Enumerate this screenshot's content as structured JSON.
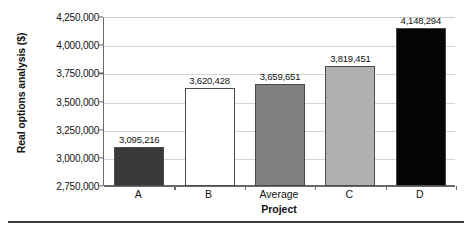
{
  "chart_data": {
    "type": "bar",
    "title": "",
    "categories": [
      "A",
      "B",
      "Average",
      "C",
      "D"
    ],
    "values": [
      3095216,
      3620428,
      3659651,
      3819451,
      4148294
    ],
    "value_labels": [
      "3,095,216",
      "3,620,428",
      "3,659,651",
      "3,819,451",
      "4,148,294"
    ],
    "bar_colors": [
      "#3a3a3a",
      "#ffffff",
      "#808080",
      "#b0b0b0",
      "#050505"
    ],
    "bar_border_color": "#4a4a4a",
    "xlabel": "Project",
    "ylabel": "Real options analysis ($)",
    "ylim": [
      2750000,
      4250000
    ],
    "ytick_values": [
      2750000,
      3000000,
      3250000,
      3500000,
      3750000,
      4000000,
      4250000
    ],
    "ytick_labels": [
      "2,750,000",
      "3,000,000",
      "3,250,000",
      "3,500,000",
      "3,750,000",
      "4,000,000",
      "4,250,000"
    ],
    "grid": true,
    "grid_axis": "y",
    "grid_color": "#d4d4d4",
    "legend": false,
    "legend_position": "none",
    "axis_color": "#6a6a6a",
    "background": "#ffffff"
  }
}
